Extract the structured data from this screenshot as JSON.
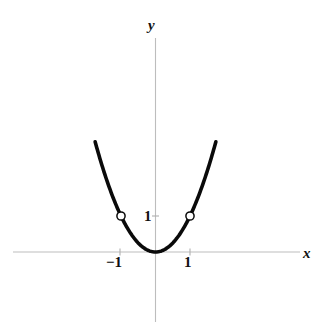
{
  "figure": {
    "background_color": "#ffffff",
    "curve_color": "#0a0a0a",
    "axis_color": "#b9b9b9",
    "marker_fill": "#ffffff",
    "marker_stroke": "#0a0a0a"
  },
  "labels": {
    "y_axis": "y",
    "x_axis": "x",
    "x_tick_negative_one": "−1",
    "x_tick_positive_one": "1",
    "y_tick_one": "1"
  },
  "chart_data": {
    "type": "line",
    "title": "",
    "subtitle": "",
    "xlabel": "x",
    "ylabel": "y",
    "grid": false,
    "legend": null,
    "xlim": [
      -2.0,
      2.0
    ],
    "ylim": [
      -0.65,
      3.05
    ],
    "axis_ticks": {
      "x": [
        -1,
        1
      ],
      "x_tick_labels": [
        "−1",
        "1"
      ],
      "y": [
        1
      ],
      "y_tick_labels": [
        "1"
      ]
    },
    "series": [
      {
        "name": "y = x²",
        "kind": "parabola",
        "equation": "y = x^2",
        "vertex": [
          0,
          0
        ],
        "x_domain": [
          -1.75,
          1.75
        ],
        "x": [
          -1.75,
          -1.5,
          -1.25,
          -1.0,
          -0.75,
          -0.5,
          -0.25,
          0,
          0.25,
          0.5,
          0.75,
          1.0,
          1.25,
          1.5,
          1.75
        ],
        "y": [
          3.0625,
          2.25,
          1.5625,
          1.0,
          0.5625,
          0.25,
          0.0625,
          0,
          0.0625,
          0.25,
          0.5625,
          1.0,
          1.5625,
          2.25,
          3.0625
        ]
      }
    ],
    "annotations": [
      {
        "kind": "open-circle",
        "label": "open point at (-1, 1)",
        "x": -1,
        "y": 1
      },
      {
        "kind": "open-circle",
        "label": "open point at (1, 1)",
        "x": 1,
        "y": 1
      }
    ]
  }
}
